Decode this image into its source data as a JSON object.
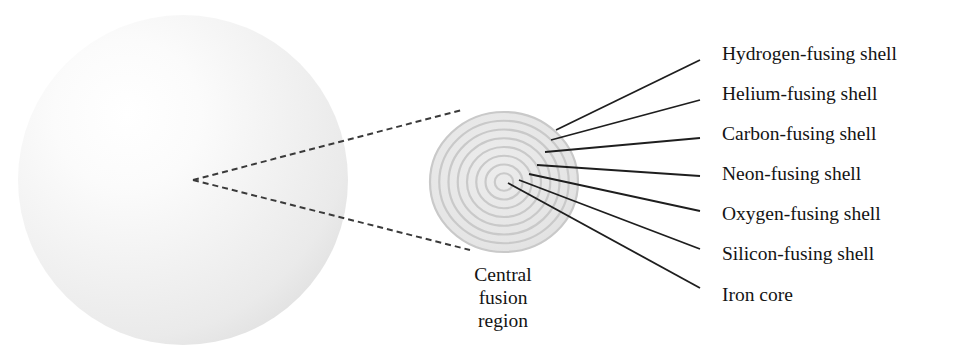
{
  "figure": {
    "background_color": "#ffffff",
    "star": {
      "name": "star-sphere",
      "center_x": 183,
      "center_y": 180,
      "radius": 165,
      "fill_light": "#ffffff",
      "fill_mid": "#f2f2f2",
      "fill_edge": "#e2e2e2",
      "highlight_x": 120,
      "highlight_y": 112
    },
    "zoom_cone": {
      "name": "zoom-cone",
      "apex_x": 193,
      "apex_y": 180,
      "upper_end_x": 462,
      "upper_end_y": 110,
      "lower_end_x": 470,
      "lower_end_y": 250,
      "color": "#3a3a3a",
      "dash": "6 4",
      "width": 2
    },
    "core_region": {
      "name": "central-fusion-region",
      "center_x": 504,
      "center_y": 182,
      "radius_x": 74,
      "radius_y": 70,
      "base_fill": "#e4e4e4",
      "ring_color": "#c9c9c9",
      "ring_count": 8,
      "caption": [
        "Central",
        "fusion",
        "region"
      ],
      "caption_x": 503,
      "caption_start_y": 277,
      "caption_line_height": 23
    },
    "leader_color": "#1e1e1e",
    "leader_width": 1.8,
    "labels": [
      {
        "id": "hydrogen-fusing-shell",
        "text": "Hydrogen-fusing shell",
        "text_x": 722,
        "text_y": 56,
        "leader_start_x": 700,
        "leader_start_y": 60,
        "leader_end_x": 556,
        "leader_end_y": 130
      },
      {
        "id": "helium-fusing-shell",
        "text": "Helium-fusing shell",
        "text_x": 722,
        "text_y": 96,
        "leader_start_x": 700,
        "leader_start_y": 100,
        "leader_end_x": 551,
        "leader_end_y": 140
      },
      {
        "id": "carbon-fusing-shell",
        "text": "Carbon-fusing shell",
        "text_x": 722,
        "text_y": 136,
        "leader_start_x": 700,
        "leader_start_y": 138,
        "leader_end_x": 545,
        "leader_end_y": 152
      },
      {
        "id": "neon-fusing-shell",
        "text": "Neon-fusing shell",
        "text_x": 722,
        "text_y": 176,
        "leader_start_x": 700,
        "leader_start_y": 176,
        "leader_end_x": 537,
        "leader_end_y": 165
      },
      {
        "id": "oxygen-fusing-shell",
        "text": "Oxygen-fusing shell",
        "text_x": 722,
        "text_y": 216,
        "leader_start_x": 700,
        "leader_start_y": 211,
        "leader_end_x": 529,
        "leader_end_y": 174
      },
      {
        "id": "silicon-fusing-shell",
        "text": "Silicon-fusing shell",
        "text_x": 722,
        "text_y": 256,
        "leader_start_x": 700,
        "leader_start_y": 249,
        "leader_end_x": 519,
        "leader_end_y": 180
      },
      {
        "id": "iron-core",
        "text": "Iron core",
        "text_x": 722,
        "text_y": 297,
        "leader_start_x": 700,
        "leader_start_y": 288,
        "leader_end_x": 508,
        "leader_end_y": 183
      }
    ]
  }
}
